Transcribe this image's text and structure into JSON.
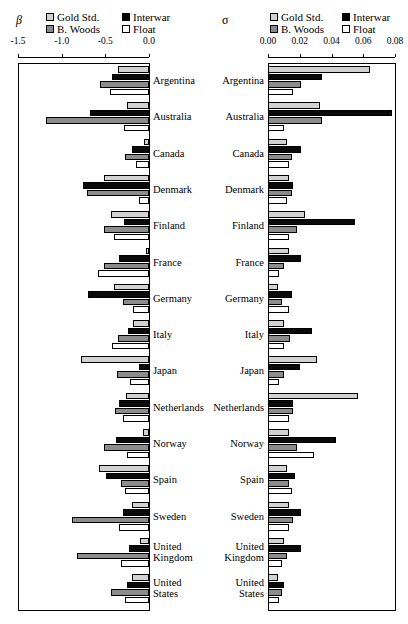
{
  "figure": {
    "panels": [
      {
        "key": "beta",
        "symbol": "β",
        "symbol_name": "beta"
      },
      {
        "key": "sigma",
        "symbol": "σ",
        "symbol_name": "sigma"
      }
    ],
    "legend": {
      "entries": [
        {
          "label": "Gold Std.",
          "color": "#d2d2d2",
          "swatch": "sw-gold"
        },
        {
          "label": "Interwar",
          "color": "#0a0a0a",
          "swatch": "sw-interwar"
        },
        {
          "label": "B. Woods",
          "color": "#8c8c8c",
          "swatch": "sw-bwoods"
        },
        {
          "label": "Float",
          "color": "#ffffff",
          "swatch": "sw-float"
        }
      ]
    },
    "countries": [
      "Argentina",
      "Australia",
      "Canada",
      "Denmark",
      "Finland",
      "France",
      "Germany",
      "Italy",
      "Japan",
      "Netherlands",
      "Norway",
      "Spain",
      "Sweden",
      "United Kingdom",
      "United States"
    ]
  },
  "chart_data": [
    {
      "type": "bar",
      "title": "β",
      "orientation": "horizontal",
      "xlabel": "",
      "ylabel": "",
      "xlim": [
        -1.5,
        0.0
      ],
      "xticks": [
        -1.5,
        -1.0,
        -0.5,
        0.0
      ],
      "xtick_labels": [
        "-1.5",
        "-1.0",
        "-0.5",
        "0.0"
      ],
      "grid": false,
      "legend_position": "top",
      "categories": [
        "Argentina",
        "Australia",
        "Canada",
        "Denmark",
        "Finland",
        "France",
        "Germany",
        "Italy",
        "Japan",
        "Netherlands",
        "Norway",
        "Spain",
        "Sweden",
        "United Kingdom",
        "United States"
      ],
      "series": [
        {
          "name": "Gold Std.",
          "values": [
            -0.36,
            -0.25,
            -0.06,
            -0.52,
            -0.44,
            -0.04,
            -0.4,
            -0.18,
            -0.78,
            -0.26,
            -0.07,
            -0.57,
            -0.2,
            -0.1,
            -0.2
          ]
        },
        {
          "name": "Interwar",
          "values": [
            -0.42,
            -0.68,
            -0.2,
            -0.76,
            -0.29,
            -0.34,
            -0.7,
            -0.24,
            -0.12,
            -0.34,
            -0.38,
            -0.49,
            -0.3,
            -0.23,
            -0.25
          ]
        },
        {
          "name": "B. Woods",
          "values": [
            -0.56,
            -1.18,
            -0.27,
            -0.71,
            -0.52,
            -0.52,
            -0.3,
            -0.35,
            -0.37,
            -0.39,
            -0.52,
            -0.32,
            -0.88,
            -0.82,
            -0.43
          ]
        },
        {
          "name": "Float",
          "values": [
            -0.45,
            -0.29,
            -0.15,
            -0.12,
            -0.4,
            -0.58,
            -0.18,
            -0.42,
            -0.22,
            -0.3,
            -0.25,
            -0.28,
            -0.34,
            -0.32,
            -0.27
          ]
        }
      ]
    },
    {
      "type": "bar",
      "title": "σ",
      "orientation": "horizontal",
      "xlabel": "",
      "ylabel": "",
      "xlim": [
        0.0,
        0.08
      ],
      "xticks": [
        0.0,
        0.02,
        0.04,
        0.06,
        0.08
      ],
      "xtick_labels": [
        "0.00",
        "0.02",
        "0.04",
        "0.06",
        "0.08"
      ],
      "grid": false,
      "legend_position": "top",
      "categories": [
        "Argentina",
        "Australia",
        "Canada",
        "Denmark",
        "Finland",
        "France",
        "Germany",
        "Italy",
        "Japan",
        "Netherlands",
        "Norway",
        "Spain",
        "Sweden",
        "United Kingdom",
        "United States"
      ],
      "series": [
        {
          "name": "Gold Std.",
          "values": [
            0.064,
            0.033,
            0.012,
            0.013,
            0.023,
            0.013,
            0.006,
            0.01,
            0.031,
            0.057,
            0.013,
            0.012,
            0.013,
            0.01,
            0.006
          ]
        },
        {
          "name": "Interwar",
          "values": [
            0.034,
            0.078,
            0.021,
            0.016,
            0.055,
            0.021,
            0.015,
            0.028,
            0.02,
            0.016,
            0.043,
            0.017,
            0.021,
            0.021,
            0.01
          ]
        },
        {
          "name": "B. Woods",
          "values": [
            0.021,
            0.034,
            0.015,
            0.015,
            0.018,
            0.01,
            0.009,
            0.014,
            0.01,
            0.016,
            0.018,
            0.013,
            0.016,
            0.012,
            0.009
          ]
        },
        {
          "name": "Float",
          "values": [
            0.016,
            0.01,
            0.013,
            0.012,
            0.013,
            0.007,
            0.013,
            0.01,
            0.007,
            0.013,
            0.029,
            0.015,
            0.013,
            0.009,
            0.007
          ]
        }
      ]
    }
  ]
}
